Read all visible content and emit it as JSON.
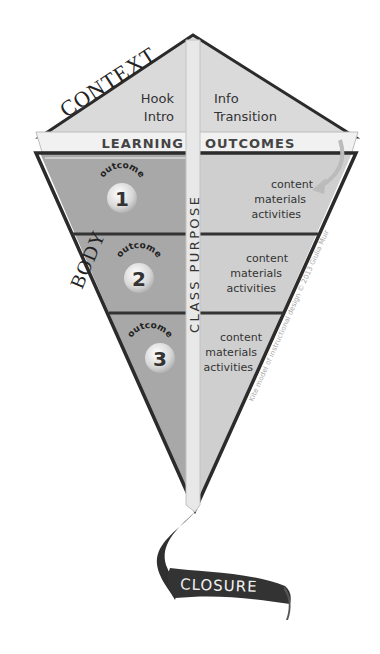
{
  "diagram": {
    "title": "Kite model of instructional design",
    "labels": {
      "context": "CONTEXT",
      "body": "BODY",
      "closure": "CLOSURE",
      "learning": "LEARNING",
      "outcomes": "OUTCOMES",
      "class_purpose": "CLASS PURPOSE"
    },
    "context_left": {
      "line1": "Hook",
      "line2": "Intro"
    },
    "context_right": {
      "line1": "Info",
      "line2": "Transition"
    },
    "outcomes": [
      {
        "badge": "outcome",
        "number": "1",
        "items": [
          "content",
          "materials",
          "activities"
        ]
      },
      {
        "badge": "outcome",
        "number": "2",
        "items": [
          "content",
          "materials",
          "activities"
        ]
      },
      {
        "badge": "outcome",
        "number": "3",
        "items": [
          "content",
          "materials",
          "activities"
        ]
      }
    ],
    "watermark": "Kite model of instructional design © 2013 Giulia Muir",
    "colors": {
      "outline": "#2b2b2b",
      "top_fill": "#d9d9d9",
      "band_fill": "#eeeeee",
      "body_left": "#a9a9a9",
      "body_right": "#cfcfcf",
      "spar": "#e6e6e6",
      "ribbon": "#333333"
    }
  }
}
